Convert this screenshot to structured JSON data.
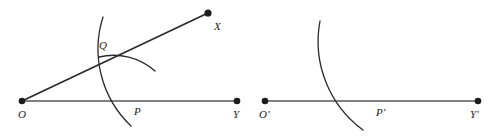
{
  "figure": {
    "background_color": "#ffffff",
    "ink_color": "#2b2b2b",
    "line_color": "#555555",
    "width": 502,
    "height": 136,
    "panels": [
      {
        "id": "left-panel",
        "name": "original-angle-panel",
        "description": "Angle XOY with arc through P and Q and a short intersecting arc",
        "points": [
          {
            "key": "O",
            "label": "O",
            "dot": true,
            "x": 22,
            "y": 101,
            "label_x": 18,
            "label_y": 118
          },
          {
            "key": "P",
            "label": "P",
            "dot": false,
            "x": 128,
            "y": 101,
            "label_x": 134,
            "label_y": 115
          },
          {
            "key": "Y",
            "label": "Y",
            "dot": true,
            "x": 237,
            "y": 101,
            "label_x": 233,
            "label_y": 118
          },
          {
            "key": "X",
            "label": "X",
            "dot": true,
            "x": 208,
            "y": 13,
            "label_x": 214,
            "label_y": 30
          },
          {
            "key": "Q",
            "label": "Q",
            "dot": false,
            "x": 118,
            "y": 57,
            "label_x": 99,
            "label_y": 49
          }
        ],
        "segments": [
          {
            "name": "ray-O-Y",
            "from": "O",
            "to": "Y"
          },
          {
            "name": "ray-O-X",
            "from": "O",
            "to": "X"
          }
        ],
        "arcs": [
          {
            "name": "arc-through-P-and-Q",
            "from_x": 103,
            "from_y": 17,
            "to_x": 131,
            "to_y": 126,
            "radius": 106,
            "sweep": 0
          },
          {
            "name": "short-arc-crossing-Q",
            "from_x": 99,
            "from_y": 57,
            "to_x": 155,
            "to_y": 71,
            "radius": 62,
            "sweep": 1
          }
        ]
      },
      {
        "id": "right-panel",
        "name": "copied-angle-panel",
        "description": "Ray O'Y' with a single arc crossing at P'",
        "points": [
          {
            "key": "O'",
            "label": "O'",
            "dot": true,
            "x": 265,
            "y": 101,
            "label_x": 259,
            "label_y": 118
          },
          {
            "key": "P'",
            "label": "P'",
            "dot": false,
            "x": 370,
            "y": 101,
            "label_x": 376,
            "label_y": 116
          },
          {
            "key": "Y'",
            "label": "Y'",
            "dot": true,
            "x": 478,
            "y": 101,
            "label_x": 472,
            "label_y": 118
          }
        ],
        "segments": [
          {
            "name": "ray-Oprime-Yprime",
            "from": "O'",
            "to": "Y'"
          }
        ],
        "arcs": [
          {
            "name": "arc-through-Pprime",
            "from_x": 320,
            "from_y": 21,
            "to_x": 363,
            "to_y": 130,
            "radius": 110,
            "sweep": 0
          }
        ]
      }
    ],
    "labels": {
      "O": "O",
      "P": "P",
      "Q": "Q",
      "X": "X",
      "Y": "Y",
      "O_prime": "O'",
      "P_prime": "P'",
      "Y_prime": "Y'"
    }
  }
}
